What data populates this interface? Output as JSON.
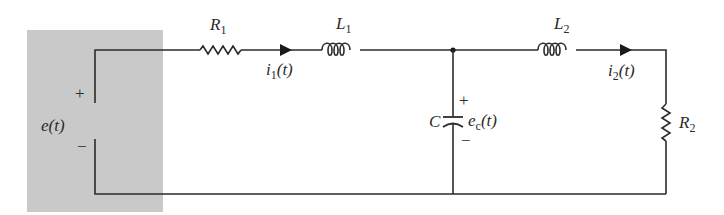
{
  "diagram": {
    "type": "electrical circuit schematic",
    "source": {
      "name": "e(t)",
      "plus": "+",
      "minus": "−",
      "shaded_color": "#c8c8c8"
    },
    "components": [
      {
        "id": "R1",
        "label": "R",
        "sub": "1",
        "kind": "resistor"
      },
      {
        "id": "L1",
        "label": "L",
        "sub": "1",
        "kind": "inductor"
      },
      {
        "id": "C",
        "label": "C",
        "kind": "capacitor"
      },
      {
        "id": "L2",
        "label": "L",
        "sub": "2",
        "kind": "inductor"
      },
      {
        "id": "R2",
        "label": "R",
        "sub": "2",
        "kind": "resistor"
      }
    ],
    "currents": [
      {
        "label": "i",
        "sub": "1",
        "arg": "(t)"
      },
      {
        "label": "i",
        "sub": "2",
        "arg": "(t)"
      }
    ],
    "capacitor_voltage": {
      "label": "e",
      "sub": "c",
      "arg": "(t)",
      "plus": "+",
      "minus": "−"
    },
    "wire_color": "#2b2b2b"
  }
}
